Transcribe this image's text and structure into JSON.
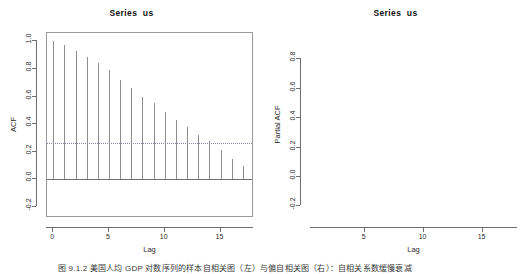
{
  "figure": {
    "background": "#ffffff",
    "width": 527,
    "height": 274,
    "caption": "图 9.1.2   美国人均 GDP 对数序列的样本自相关图（左）与偏自相关图（右）：自相关系数缓慢衰减"
  },
  "panels": [
    {
      "id": "acf",
      "title": "Series  us",
      "ylabel": "ACF",
      "xlabel": "Lag"
    },
    {
      "id": "pacf",
      "title": "Series  us",
      "ylabel": "Partial ACF",
      "xlabel": "Lag"
    }
  ],
  "chart_data": [
    {
      "type": "bar",
      "id": "acf",
      "title": "Series  us",
      "xlabel": "Lag",
      "ylabel": "ACF",
      "xlim": [
        -0.55,
        18.0
      ],
      "ylim": [
        -0.28,
        1.06
      ],
      "xticks": [
        0,
        5,
        10,
        15
      ],
      "xticklabels": [
        "0",
        "5",
        "10",
        "15"
      ],
      "yticks": [
        -0.2,
        0.0,
        0.2,
        0.4,
        0.6,
        0.8,
        1.0
      ],
      "yticklabels": [
        "-0.2",
        "0.0",
        "0.2",
        "0.4",
        "0.6",
        "0.8",
        "1.0"
      ],
      "grid": false,
      "legend": null,
      "zero_line": 0.0,
      "confidence_bounds": [
        0.265,
        -0.265
      ],
      "confidence_style": "dotted",
      "x": [
        0,
        1,
        2,
        3,
        4,
        5,
        6,
        7,
        8,
        9,
        10,
        11,
        12,
        13,
        14,
        15,
        16,
        17
      ],
      "values": [
        1.0,
        0.97,
        0.93,
        0.89,
        0.84,
        0.79,
        0.72,
        0.66,
        0.6,
        0.55,
        0.49,
        0.43,
        0.38,
        0.32,
        0.28,
        0.21,
        0.15,
        0.1,
        0.05
      ]
    },
    {
      "type": "bar",
      "id": "pacf",
      "title": "Series  us",
      "xlabel": "Lag",
      "ylabel": "Partial ACF",
      "xlim": [
        0.45,
        18.0
      ],
      "ylim": [
        -0.28,
        0.98
      ],
      "xticks": [
        5,
        10,
        15
      ],
      "xticklabels": [
        "5",
        "10",
        "15"
      ],
      "yticks": [
        -0.2,
        0.0,
        0.2,
        0.4,
        0.6,
        0.8
      ],
      "yticklabels": [
        "-0.2",
        "0.0",
        "0.2",
        "0.4",
        "0.6",
        "0.8"
      ],
      "grid": false,
      "legend": null,
      "zero_line": 0.0,
      "confidence_bounds": [
        0.265,
        -0.265
      ],
      "confidence_style": "dotted",
      "x": [
        1,
        2,
        3,
        4,
        5,
        6,
        7,
        8,
        9,
        10,
        11,
        12,
        13,
        14,
        15,
        16,
        17
      ],
      "values": [
        0.96,
        -0.05,
        -0.04,
        -0.11,
        -0.05,
        -0.03,
        -0.02,
        -0.02,
        -0.03,
        -0.03,
        -0.04,
        -0.02,
        -0.02,
        -0.02,
        -0.03,
        -0.04,
        -0.02
      ]
    }
  ]
}
